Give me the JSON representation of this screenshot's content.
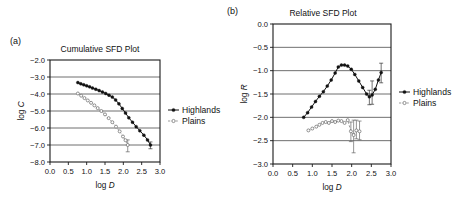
{
  "figure": {
    "panel_a_label": "(a)",
    "panel_b_label": "(b)"
  },
  "legend": {
    "highlands": "Highlands",
    "plains": "Plains"
  },
  "chart_data": [
    {
      "id": "cumulative",
      "type": "line",
      "title": "Cumulative SFD Plot",
      "xlabel": "log D",
      "ylabel": "log C",
      "xlim": [
        0.0,
        3.0
      ],
      "ylim": [
        -8.0,
        -2.0
      ],
      "xticks": [
        "0.0",
        "0.5",
        "1.0",
        "1.5",
        "2.0",
        "2.5",
        "3.0"
      ],
      "xtick_values": [
        0.0,
        0.5,
        1.0,
        1.5,
        2.0,
        2.5,
        3.0
      ],
      "yticks": [
        "-2.0",
        "-3.0",
        "-4.0",
        "-5.0",
        "-6.0",
        "-7.0",
        "-8.0"
      ],
      "ytick_values": [
        -2.0,
        -3.0,
        -4.0,
        -5.0,
        -6.0,
        -7.0,
        -8.0
      ],
      "grid": true,
      "legend_position": "right",
      "series": [
        {
          "name": "Highlands",
          "marker": "filled-circle",
          "linestyle": "solid",
          "x": [
            0.76,
            0.84,
            0.92,
            1.0,
            1.08,
            1.16,
            1.25,
            1.34,
            1.43,
            1.52,
            1.61,
            1.7,
            1.79,
            1.88,
            1.97,
            2.06,
            2.15,
            2.25,
            2.35,
            2.45,
            2.56,
            2.66,
            2.74
          ],
          "y": [
            -3.33,
            -3.4,
            -3.46,
            -3.52,
            -3.58,
            -3.65,
            -3.72,
            -3.8,
            -3.88,
            -3.97,
            -4.07,
            -4.18,
            -4.35,
            -4.58,
            -4.85,
            -5.12,
            -5.4,
            -5.66,
            -5.92,
            -6.16,
            -6.42,
            -6.7,
            -7.0
          ],
          "error": [
            {
              "x": 2.74,
              "y": -7.0,
              "lo": 0.22,
              "hi": 0.18
            }
          ]
        },
        {
          "name": "Plains",
          "marker": "open-circle",
          "linestyle": "dashed",
          "x": [
            0.76,
            0.85,
            0.94,
            1.03,
            1.12,
            1.21,
            1.3,
            1.4,
            1.5,
            1.6,
            1.7,
            1.8,
            1.9,
            1.99,
            2.06,
            2.12
          ],
          "y": [
            -3.97,
            -4.1,
            -4.24,
            -4.38,
            -4.52,
            -4.67,
            -4.83,
            -5.0,
            -5.2,
            -5.42,
            -5.66,
            -5.92,
            -6.2,
            -6.5,
            -6.72,
            -7.0
          ],
          "error": [
            {
              "x": 2.12,
              "y": -7.0,
              "lo": 0.4,
              "hi": 0.3
            }
          ]
        }
      ]
    },
    {
      "id": "relative",
      "type": "line",
      "title": "Relative SFD Plot",
      "xlabel": "log D",
      "ylabel": "log R",
      "xlim": [
        0.0,
        3.0
      ],
      "ylim": [
        -3.0,
        0.0
      ],
      "xticks": [
        "0.0",
        "0.5",
        "1.0",
        "1.5",
        "2.0",
        "2.5",
        "3.0"
      ],
      "xtick_values": [
        0.0,
        0.5,
        1.0,
        1.5,
        2.0,
        2.5,
        3.0
      ],
      "yticks": [
        "0.0",
        "-0.5",
        "-1.0",
        "-1.5",
        "-2.0",
        "-2.5",
        "-3.0"
      ],
      "ytick_values": [
        0.0,
        -0.5,
        -1.0,
        -1.5,
        -2.0,
        -2.5,
        -3.0
      ],
      "grid": true,
      "legend_position": "right",
      "series": [
        {
          "name": "Highlands",
          "marker": "filled-circle",
          "linestyle": "solid",
          "x": [
            0.78,
            0.88,
            0.98,
            1.08,
            1.18,
            1.28,
            1.38,
            1.48,
            1.58,
            1.66,
            1.74,
            1.82,
            1.9,
            1.99,
            2.08,
            2.18,
            2.28,
            2.38,
            2.45,
            2.52,
            2.6,
            2.68,
            2.75
          ],
          "y": [
            -2.0,
            -1.9,
            -1.78,
            -1.66,
            -1.55,
            -1.45,
            -1.33,
            -1.2,
            -1.05,
            -0.92,
            -0.88,
            -0.88,
            -0.9,
            -0.97,
            -1.08,
            -1.22,
            -1.36,
            -1.5,
            -1.56,
            -1.52,
            -1.4,
            -1.2,
            -1.04
          ],
          "error": [
            {
              "x": 2.45,
              "y": -1.56,
              "lo": 0.17,
              "hi": 0.14
            },
            {
              "x": 2.52,
              "y": -1.52,
              "lo": 0.2,
              "hi": 0.3
            },
            {
              "x": 2.75,
              "y": -1.04,
              "lo": 0.22,
              "hi": 0.2
            }
          ]
        },
        {
          "name": "Plains",
          "marker": "open-circle",
          "linestyle": "dashed",
          "x": [
            0.9,
            1.0,
            1.1,
            1.18,
            1.26,
            1.34,
            1.42,
            1.5,
            1.58,
            1.66,
            1.74,
            1.82,
            1.9,
            1.98,
            2.05,
            2.12,
            2.2
          ],
          "y": [
            -2.28,
            -2.24,
            -2.2,
            -2.16,
            -2.12,
            -2.1,
            -2.12,
            -2.08,
            -2.1,
            -2.07,
            -2.08,
            -2.12,
            -2.06,
            -2.3,
            -2.38,
            -2.28,
            -2.3
          ],
          "error": [
            {
              "x": 1.98,
              "y": -2.3,
              "lo": 0.22,
              "hi": 0.2
            },
            {
              "x": 2.05,
              "y": -2.38,
              "lo": 0.38,
              "hi": 0.32
            },
            {
              "x": 2.12,
              "y": -2.28,
              "lo": 0.18,
              "hi": 0.22
            },
            {
              "x": 2.2,
              "y": -2.3,
              "lo": 0.18,
              "hi": 0.22
            }
          ]
        }
      ]
    }
  ]
}
